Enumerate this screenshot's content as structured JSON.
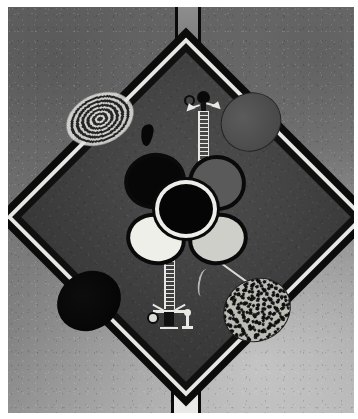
{
  "artwork": {
    "title": "Abstract composition with central diamond",
    "medium_appearance": "monochrome print on textured paper",
    "canvas": {
      "width_px": 358,
      "height_px": 419
    },
    "palette": {
      "paper_light": "#a8a8a8",
      "paper_dark": "#6b6b6b",
      "diamond_field": "#444444",
      "outline_black": "#0b0b0b",
      "highlight_white": "#e6e6e4",
      "mid_gray": "#5a5a5a",
      "pale_gray": "#cfcfc9"
    },
    "elements": [
      {
        "name": "gate-top",
        "shape": "rectangle",
        "description": "Open-topped outlined rectangle at top centre",
        "fill": "#7b7b7b",
        "stroke": "#0a0a0a",
        "position": {
          "x": 167,
          "y": -2,
          "w": 26,
          "h": 47
        }
      },
      {
        "name": "gate-bottom",
        "shape": "rectangle",
        "description": "Open-bottomed outlined white rectangle at bottom centre",
        "fill": "#e9e9e7",
        "stroke": "#0a0a0a",
        "position": {
          "x": 163,
          "y": 376,
          "w": 30,
          "h": 46
        }
      },
      {
        "name": "central-diamond",
        "shape": "square rotated 45 degrees",
        "description": "Large dark diamond with black border and inner white pinstripe",
        "fill": "#444444",
        "stroke": "#0b0b0b",
        "inner_line": "#e6e6e4",
        "position": {
          "cx": 178,
          "cy": 210,
          "side": 268
        }
      },
      {
        "name": "ellipse-concentric-rings",
        "shape": "ellipse",
        "description": "Upper-left bullseye of concentric light and dark rings",
        "rotation_deg": -24,
        "position": {
          "x": 57,
          "y": 87,
          "w": 70,
          "h": 50
        }
      },
      {
        "name": "ellipse-gray-top-right",
        "shape": "ellipse",
        "description": "Upper-right mid-gray ellipse with thin dark outline",
        "fill": "#4a4a4a",
        "rotation_deg": -35,
        "position": {
          "x": 212,
          "y": 86,
          "w": 62,
          "h": 58
        }
      },
      {
        "name": "ellipse-black-bottom-left",
        "shape": "ellipse",
        "description": "Lower-left solid black ellipse",
        "fill": "#070707",
        "rotation_deg": -32,
        "position": {
          "x": 48,
          "y": 265,
          "w": 66,
          "h": 58
        }
      },
      {
        "name": "ellipse-speckled-bottom-right",
        "shape": "ellipse",
        "description": "Lower-right pale ellipse densely mottled with dark flecks",
        "fill": "#bdbdb8",
        "rotation_deg": -33,
        "position": {
          "x": 214,
          "y": 272,
          "w": 70,
          "h": 62
        }
      },
      {
        "name": "central-flower",
        "shape": "four-petal rosette",
        "description": "Four outlined petals around a black disc ringed in white",
        "petals": [
          {
            "name": "petal-upper-left",
            "fill": "#070707"
          },
          {
            "name": "petal-upper-right",
            "fill": "#5a5a5a"
          },
          {
            "name": "petal-lower-left",
            "fill": "#efefea"
          },
          {
            "name": "petal-lower-right",
            "fill": "#cfcfc9"
          }
        ],
        "core": {
          "fill": "#050505",
          "ring": "#ededea"
        },
        "position": {
          "cx": 178,
          "cy": 202
        }
      },
      {
        "name": "totem-upper",
        "shape": "figure",
        "description": "Upright totem: two circular heads (one outlined, one filled), outstretched arms, ladder-rung body descending toward the flower",
        "position": {
          "x": 176,
          "y": 84,
          "w": 36,
          "h": 82
        }
      },
      {
        "name": "totem-lower",
        "shape": "figure",
        "description": "Inverted totem: ladder-rung shaft rising from a splayed crown-like base with a small circle and a pawn-like finial",
        "position": {
          "x": 140,
          "y": 252,
          "w": 50,
          "h": 80
        }
      },
      {
        "name": "bird-blob",
        "shape": "irregular blob",
        "description": "Small solid black bird-like silhouette left of the upper totem",
        "fill": "#070707",
        "position": {
          "x": 133,
          "y": 117,
          "w": 12,
          "h": 22
        }
      },
      {
        "name": "squiggle-mark",
        "shape": "curved stroke",
        "description": "Small pale hook-shaped squiggle below and right of the flower",
        "position": {
          "x": 190,
          "y": 262,
          "w": 10,
          "h": 28
        }
      },
      {
        "name": "diagonal-line",
        "shape": "line",
        "description": "Thin pale diagonal line running from the flower toward the lower-right diamond edge",
        "rotation_deg": 36,
        "position": {
          "x": 206,
          "y": 250,
          "length": 64
        }
      }
    ]
  }
}
